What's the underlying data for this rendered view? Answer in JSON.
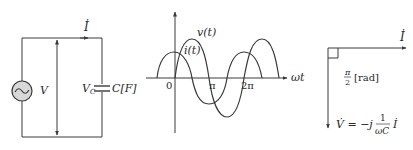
{
  "circuit": {
    "current_label": "İ",
    "source_voltage_label": "V",
    "capacitor_voltage_label": "V",
    "capacitor_voltage_subscript": "C",
    "capacitor_label": "C[F]",
    "source_icon": "ac-source-icon"
  },
  "waveform": {
    "voltage_label": "v(t)",
    "current_label": "i(t)",
    "x_axis_label": "ωt",
    "origin_label": "0",
    "tick_pi": "π",
    "tick_2pi": "2π"
  },
  "phasor": {
    "current_label": "İ",
    "angle_numerator": "π",
    "angle_denominator": "2",
    "angle_unit": "[rad]",
    "voltage_lhs": "V̇ = −j",
    "voltage_frac_num": "1",
    "voltage_frac_den": "ωC",
    "voltage_rhs": "İ"
  },
  "colors": {
    "line": "#3a3a3a",
    "source_fill": "#d8d8d8",
    "background": "#ffffff"
  }
}
